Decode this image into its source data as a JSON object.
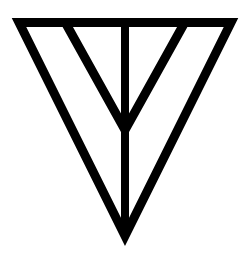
{
  "figure": {
    "label": "Inverted triangle symbol with vertical line and inner V",
    "background": "#ffffff",
    "stroke_color": "#000000",
    "stroke_width": 9,
    "outer_triangle": {
      "points": [
        [
          19,
          22.5
        ],
        [
          231,
          22.5
        ],
        [
          125,
          236
        ]
      ]
    },
    "vertical_line": {
      "x": 125,
      "y1": 22,
      "y2": 236
    },
    "inner_v": {
      "left": [
        65,
        22
      ],
      "apex": [
        125,
        130
      ],
      "right": [
        185,
        22
      ]
    }
  }
}
